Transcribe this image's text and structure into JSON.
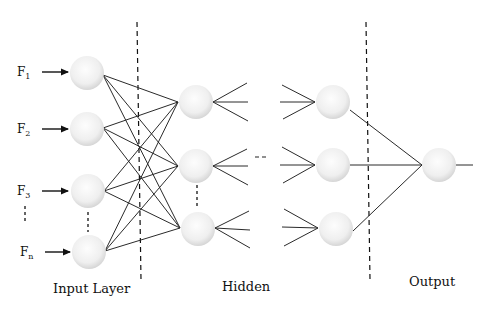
{
  "diagram": {
    "type": "neural-network-architecture",
    "inputs": [
      {
        "letter": "F",
        "sub": "1"
      },
      {
        "letter": "F",
        "sub": "2"
      },
      {
        "letter": "F",
        "sub": "3"
      },
      {
        "letter": "F",
        "sub": "n"
      }
    ],
    "layer_labels": {
      "input": "Input Layer",
      "hidden": "Hidden",
      "output": "Output"
    },
    "hidden_ellipsis": "- -",
    "colors": {
      "node_fill_center": "#fbfbfb",
      "node_fill_edge": "#d8d8d8",
      "line": "#2a2a2a",
      "background": "#ffffff"
    }
  }
}
